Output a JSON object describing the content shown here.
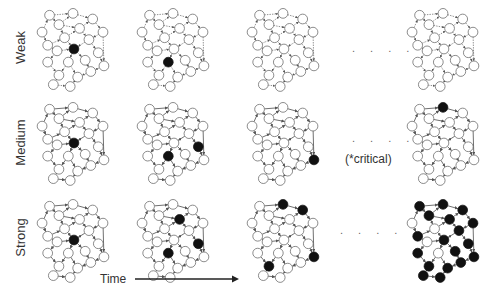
{
  "rows": [
    {
      "label": "Weak"
    },
    {
      "label": "Medium"
    },
    {
      "label": "Strong"
    }
  ],
  "ellipsis": ". . . .",
  "critical_note": "(*critical)",
  "time_label": "Time",
  "colors": {
    "active": "#111111",
    "inactive": "#ffffff",
    "edge": "#555555"
  },
  "network": {
    "nodes": [
      [
        20,
        12
      ],
      [
        45,
        10
      ],
      [
        66,
        16
      ],
      [
        77,
        30
      ],
      [
        12,
        30
      ],
      [
        30,
        22
      ],
      [
        52,
        26
      ],
      [
        18,
        44
      ],
      [
        36,
        36
      ],
      [
        62,
        38
      ],
      [
        28,
        50
      ],
      [
        46,
        48
      ],
      [
        72,
        52
      ],
      [
        18,
        62
      ],
      [
        40,
        62
      ],
      [
        58,
        60
      ],
      [
        78,
        66
      ],
      [
        30,
        76
      ],
      [
        50,
        78
      ],
      [
        64,
        72
      ],
      [
        42,
        88
      ],
      [
        24,
        86
      ]
    ],
    "edges": [
      [
        0,
        1
      ],
      [
        1,
        2
      ],
      [
        2,
        3
      ],
      [
        0,
        5
      ],
      [
        5,
        1
      ],
      [
        4,
        0
      ],
      [
        4,
        7
      ],
      [
        5,
        6
      ],
      [
        6,
        2
      ],
      [
        6,
        9
      ],
      [
        3,
        9
      ],
      [
        7,
        8
      ],
      [
        8,
        6
      ],
      [
        8,
        11
      ],
      [
        9,
        12
      ],
      [
        10,
        7
      ],
      [
        10,
        13
      ],
      [
        11,
        14
      ],
      [
        11,
        15
      ],
      [
        12,
        16
      ],
      [
        13,
        17
      ],
      [
        14,
        17
      ],
      [
        15,
        19
      ],
      [
        16,
        19
      ],
      [
        17,
        21
      ],
      [
        18,
        20
      ],
      [
        19,
        18
      ],
      [
        21,
        20
      ],
      [
        14,
        18
      ],
      [
        10,
        11
      ],
      [
        3,
        16
      ],
      [
        5,
        8
      ],
      [
        9,
        11
      ]
    ]
  },
  "panels": [
    {
      "row": 0,
      "col": 0,
      "active": [
        11
      ]
    },
    {
      "row": 0,
      "col": 1,
      "active": [
        14
      ]
    },
    {
      "row": 0,
      "col": 2,
      "active": []
    },
    {
      "row": 0,
      "col": 3,
      "active": []
    },
    {
      "row": 1,
      "col": 0,
      "active": [
        11
      ]
    },
    {
      "row": 1,
      "col": 1,
      "active": [
        14,
        12
      ]
    },
    {
      "row": 1,
      "col": 2,
      "active": [
        16
      ]
    },
    {
      "row": 1,
      "col": 3,
      "active": [
        1
      ]
    },
    {
      "row": 2,
      "col": 0,
      "active": [
        11
      ]
    },
    {
      "row": 2,
      "col": 1,
      "active": [
        14,
        6,
        12
      ]
    },
    {
      "row": 2,
      "col": 2,
      "active": [
        1,
        2,
        16,
        17
      ]
    },
    {
      "row": 2,
      "col": 3,
      "active": [
        0,
        1,
        2,
        3,
        5,
        6,
        7,
        9,
        12,
        13,
        15,
        16,
        17,
        19,
        20,
        21,
        11,
        18
      ]
    }
  ]
}
